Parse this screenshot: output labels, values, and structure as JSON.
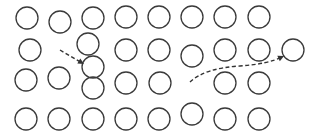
{
  "diagram": {
    "type": "lattice-defect-diagram",
    "background": "#ffffff",
    "stroke_color": "#3a3a3a",
    "atom_radius": 11,
    "atoms": [
      {
        "row": 1,
        "x": 27,
        "y": 18
      },
      {
        "row": 1,
        "x": 60,
        "y": 22
      },
      {
        "row": 1,
        "x": 93,
        "y": 18
      },
      {
        "row": 1,
        "x": 126,
        "y": 17
      },
      {
        "row": 1,
        "x": 159,
        "y": 17
      },
      {
        "row": 1,
        "x": 192,
        "y": 17
      },
      {
        "row": 1,
        "x": 225,
        "y": 17
      },
      {
        "row": 1,
        "x": 259,
        "y": 17
      },
      {
        "row": 2,
        "x": 30,
        "y": 50
      },
      {
        "row": 2,
        "x": 88,
        "y": 44
      },
      {
        "row": 2,
        "x": 126,
        "y": 50
      },
      {
        "row": 2,
        "x": 159,
        "y": 50
      },
      {
        "row": 2,
        "x": 192,
        "y": 56
      },
      {
        "row": 2,
        "x": 225,
        "y": 50
      },
      {
        "row": 2,
        "x": 259,
        "y": 50
      },
      {
        "row": 2,
        "x": 293,
        "y": 50
      },
      {
        "row": 3,
        "x": 93,
        "y": 67,
        "note": "interstitial"
      },
      {
        "row": 3,
        "x": 26,
        "y": 80
      },
      {
        "row": 3,
        "x": 59,
        "y": 78
      },
      {
        "row": 3,
        "x": 93,
        "y": 88
      },
      {
        "row": 3,
        "x": 126,
        "y": 83
      },
      {
        "row": 3,
        "x": 160,
        "y": 83
      },
      {
        "row": 3,
        "x": 225,
        "y": 83
      },
      {
        "row": 3,
        "x": 259,
        "y": 83
      },
      {
        "row": 4,
        "x": 26,
        "y": 119
      },
      {
        "row": 4,
        "x": 59,
        "y": 119
      },
      {
        "row": 4,
        "x": 93,
        "y": 119
      },
      {
        "row": 4,
        "x": 126,
        "y": 119
      },
      {
        "row": 4,
        "x": 159,
        "y": 119
      },
      {
        "row": 4,
        "x": 192,
        "y": 114
      },
      {
        "row": 4,
        "x": 225,
        "y": 119
      },
      {
        "row": 4,
        "x": 259,
        "y": 119
      }
    ],
    "vacancy": {
      "x": 192,
      "y": 83
    },
    "arrows": [
      {
        "name": "interstitial-migration-arrow",
        "d": "M60 50 L82 63",
        "head": {
          "x": 84,
          "y": 64,
          "angle": 30
        }
      },
      {
        "name": "vacancy-migration-arrow",
        "d": "M190 82 Q205 68 240 66 Q268 64 282 57",
        "head": {
          "x": 284,
          "y": 56,
          "angle": -25
        }
      }
    ]
  }
}
